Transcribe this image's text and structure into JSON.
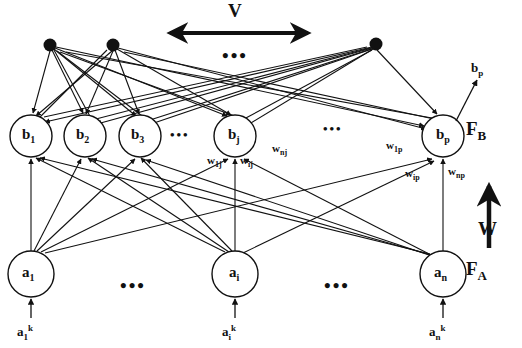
{
  "figure": {
    "background_color": "#ffffff",
    "stroke_color": "#111111"
  },
  "top_layer": {
    "name": "hidden-dot-layer",
    "dots": [
      {
        "id": "dot-1",
        "cx": 50,
        "cy": 45,
        "r": 6
      },
      {
        "id": "dot-2",
        "cx": 113,
        "cy": 45,
        "r": 6
      },
      {
        "id": "dot-3",
        "cx": 376,
        "cy": 44,
        "r": 6
      }
    ],
    "ellipsis": "•••",
    "ellipsis_x": 233,
    "ellipsis_y": 50
  },
  "v_arrow": {
    "label": "V",
    "label_x": 228,
    "label_y": 3,
    "x1": 168,
    "x2": 310,
    "y": 33
  },
  "b_layer": {
    "name": "F_B layer",
    "field_label": "F",
    "field_sub": "B",
    "field_x": 466,
    "field_y": 122,
    "radius": 21,
    "cy": 136,
    "nodes": [
      {
        "id": "node-b1",
        "label": "b",
        "sub": "1",
        "cx": 31
      },
      {
        "id": "node-b2",
        "label": "b",
        "sub": "2",
        "cx": 85
      },
      {
        "id": "node-b3",
        "label": "b",
        "sub": "3",
        "cx": 140
      },
      {
        "id": "node-bj",
        "label": "b",
        "sub": "j",
        "cx": 235
      },
      {
        "id": "node-bp",
        "label": "b",
        "sub": "p",
        "cx": 443
      }
    ],
    "ellipsis_1": {
      "text": "•••",
      "x": 177,
      "y": 128
    },
    "ellipsis_2": {
      "text": "•••",
      "x": 330,
      "y": 122
    }
  },
  "a_layer": {
    "name": "F_A layer",
    "field_label": "F",
    "field_sub": "A",
    "field_x": 466,
    "field_y": 262,
    "radius": 23,
    "cy": 274,
    "nodes": [
      {
        "id": "node-a1",
        "label": "a",
        "sub": "1",
        "cx": 31
      },
      {
        "id": "node-ai",
        "label": "a",
        "sub": "i",
        "cx": 235
      },
      {
        "id": "node-an",
        "label": "a",
        "sub": "n",
        "cx": 443
      }
    ],
    "ellipsis_1": {
      "text": "•••",
      "x": 126,
      "y": 279
    },
    "ellipsis_2": {
      "text": "•••",
      "x": 330,
      "y": 279
    }
  },
  "inputs": [
    {
      "id": "input-a1k",
      "base": "a",
      "sub": "1",
      "sup": "k",
      "x": 17,
      "y": 325,
      "arrow_x": 31
    },
    {
      "id": "input-aik",
      "base": "a",
      "sub": "i",
      "sup": "k",
      "x": 223,
      "y": 325,
      "arrow_x": 235
    },
    {
      "id": "input-ank",
      "base": "a",
      "sub": "n",
      "sup": "k",
      "x": 430,
      "y": 325,
      "arrow_x": 443
    }
  ],
  "output": {
    "id": "output-bp",
    "base": "b",
    "sub": "p",
    "label_x": 471,
    "label_y": 64,
    "arrow": {
      "x1": 455,
      "y1": 121,
      "x2": 475,
      "y2": 82
    }
  },
  "weight_labels": [
    {
      "id": "weight-w1j",
      "base": "w",
      "sub": "1j",
      "x": 208,
      "y": 158
    },
    {
      "id": "weight-wij",
      "base": "w",
      "sub": "ij",
      "x": 239,
      "y": 158
    },
    {
      "id": "weight-wnj",
      "base": "w",
      "sub": "nj",
      "x": 272,
      "y": 146
    },
    {
      "id": "weight-w1p",
      "base": "w",
      "sub": "1p",
      "x": 388,
      "y": 143
    },
    {
      "id": "weight-wip",
      "base": "w",
      "sub": "ip",
      "x": 406,
      "y": 170
    },
    {
      "id": "weight-wnp",
      "base": "w",
      "sub": "np",
      "x": 448,
      "y": 168
    }
  ],
  "w_arrow": {
    "label": "W",
    "label_x": 478,
    "label_y": 222,
    "x": 488,
    "y1": 245,
    "y2": 185
  }
}
